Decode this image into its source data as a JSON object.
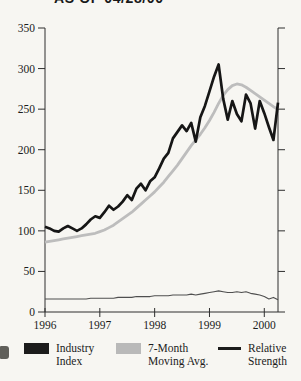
{
  "title": "AS OF 04/28/00",
  "colors": {
    "background": "#f7f6f2",
    "axis": "#2e2e2e",
    "text": "#1c1c1c",
    "industry": "#161616",
    "moving_avg": "#bdbdbd",
    "relative_strength": "#4f4f4f"
  },
  "chart_data": {
    "type": "line",
    "title": "AS OF 04/28/00",
    "xlabel": "",
    "ylabel": "",
    "ylim": [
      0,
      350
    ],
    "y_ticks": [
      0,
      50,
      100,
      150,
      200,
      250,
      300,
      350
    ],
    "x_tick_labels": [
      "1996",
      "1997",
      "1998",
      "1999",
      "2000"
    ],
    "x_unit": "month",
    "x_range": "Jan 1996 - Apr 2000",
    "grid": false,
    "legend_position": "bottom",
    "series": [
      {
        "name": "Industry Index",
        "values": [
          105,
          103,
          100,
          99,
          103,
          106,
          103,
          100,
          103,
          108,
          114,
          118,
          116,
          123,
          131,
          126,
          130,
          136,
          144,
          138,
          152,
          158,
          150,
          161,
          166,
          177,
          189,
          196,
          214,
          222,
          230,
          223,
          233,
          210,
          240,
          254,
          272,
          290,
          305,
          263,
          237,
          260,
          244,
          235,
          268,
          257,
          226,
          260,
          245,
          228,
          212,
          258
        ]
      },
      {
        "name": "7-Month Moving Avg.",
        "values": [
          86,
          87,
          88,
          89,
          90,
          91,
          92,
          93,
          94,
          95,
          96,
          97,
          99,
          101,
          104,
          107,
          111,
          115,
          119,
          123,
          128,
          133,
          138,
          143,
          148,
          154,
          160,
          167,
          174,
          181,
          189,
          197,
          205,
          212,
          219,
          227,
          236,
          246,
          257,
          267,
          274,
          279,
          281,
          280,
          277,
          273,
          269,
          265,
          261,
          257,
          253,
          250
        ]
      },
      {
        "name": "Relative Strength",
        "values": [
          16,
          16,
          16,
          16,
          16,
          16,
          16,
          16,
          16,
          16,
          17,
          17,
          17,
          17,
          17,
          17,
          18,
          18,
          18,
          18,
          19,
          19,
          19,
          19,
          20,
          20,
          20,
          20,
          21,
          21,
          21,
          21,
          22,
          21,
          22,
          23,
          24,
          25,
          26,
          25,
          24,
          24,
          25,
          24,
          25,
          23,
          22,
          21,
          19,
          16,
          18,
          15
        ]
      }
    ]
  },
  "legend": {
    "items": [
      {
        "label": "Industry\nIndex",
        "swatch": "filled-black-swatch"
      },
      {
        "label": "7-Month\nMoving Avg.",
        "swatch": "filled-gray-swatch"
      },
      {
        "label": "Relative\nStrength",
        "swatch": "black-line-swatch"
      }
    ]
  }
}
